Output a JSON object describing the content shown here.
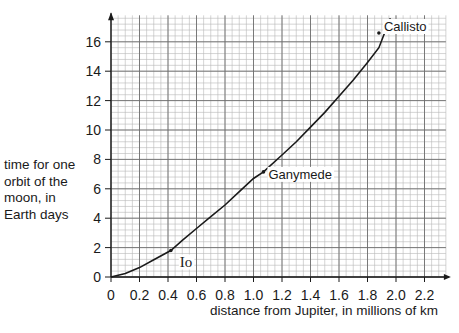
{
  "chart_data": {
    "type": "line",
    "title": "",
    "xlabel": "distance from Jupiter, in millions of km",
    "ylabel": "time for one orbit of the moon, in Earth days",
    "ylabel_lines": [
      "time for one",
      "orbit of the",
      "moon, in",
      "Earth days"
    ],
    "xlim": [
      0,
      2.35
    ],
    "ylim": [
      0,
      17.8
    ],
    "x_ticks": [
      0,
      0.2,
      0.4,
      0.6,
      0.8,
      1.0,
      1.2,
      1.4,
      1.6,
      1.8,
      2.0,
      2.2
    ],
    "x_tick_labels": [
      "0",
      "0.2",
      "0.4",
      "0.6",
      "0.8",
      "1.0",
      "1.2",
      "1.4",
      "1.6",
      "1.8",
      "2.0",
      "2.2"
    ],
    "y_ticks": [
      0,
      2,
      4,
      6,
      8,
      10,
      12,
      14,
      16
    ],
    "y_tick_labels": [
      "0",
      "2",
      "4",
      "6",
      "8",
      "10",
      "12",
      "14",
      "16"
    ],
    "grid": true,
    "grid_minor_x": 0.05,
    "grid_minor_y": 0.4,
    "legend": null,
    "series": [
      {
        "name": "orbital period curve",
        "x": [
          0,
          0.1,
          0.2,
          0.3,
          0.42,
          0.5,
          0.6,
          0.7,
          0.8,
          0.9,
          1.0,
          1.07,
          1.2,
          1.3,
          1.4,
          1.5,
          1.6,
          1.7,
          1.8,
          1.88,
          1.96
        ],
        "values": [
          0,
          0.23,
          0.64,
          1.17,
          1.8,
          2.5,
          3.3,
          4.1,
          4.9,
          5.8,
          6.7,
          7.15,
          8.3,
          9.2,
          10.2,
          11.2,
          12.3,
          13.4,
          14.6,
          15.6,
          17.6
        ]
      }
    ],
    "annotations": [
      {
        "label": "Io",
        "x": 0.42,
        "y": 1.8
      },
      {
        "label": "Ganymede",
        "x": 1.07,
        "y": 7.15
      },
      {
        "label": "Callisto",
        "x": 1.88,
        "y": 16.6
      }
    ]
  }
}
